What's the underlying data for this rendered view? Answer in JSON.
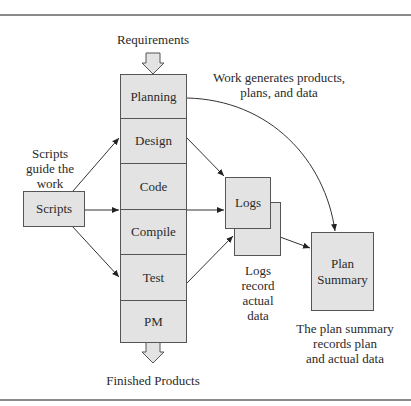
{
  "diagram": {
    "top_input": "Requirements",
    "bottom_output": "Finished Products",
    "process_phases": [
      {
        "label": "Planning"
      },
      {
        "label": "Design"
      },
      {
        "label": "Code"
      },
      {
        "label": "Compile"
      },
      {
        "label": "Test"
      },
      {
        "label": "PM"
      }
    ],
    "scripts": {
      "box_label": "Scripts",
      "caption_lines": [
        "Scripts",
        "guide the",
        "work"
      ]
    },
    "logs": {
      "box_label": "Logs",
      "caption_lines": [
        "Logs",
        "record",
        "actual",
        "data"
      ]
    },
    "plan_summary": {
      "box_label_lines": [
        "Plan",
        "Summary"
      ],
      "caption_lines": [
        "The plan summary",
        "records plan",
        "and actual data"
      ]
    },
    "work_caption_lines": [
      "Work generates products,",
      "plans, and data"
    ],
    "colors": {
      "box_fill": "#e3e3e3",
      "box_border": "#555555",
      "line": "#333333",
      "rule": "#8a8a8a"
    }
  }
}
